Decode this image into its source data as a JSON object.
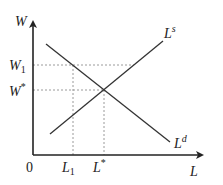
{
  "diagram": {
    "type": "labor-market supply and demand",
    "axes": {
      "y_label": "W",
      "x_label": "L",
      "origin_label": "0"
    },
    "curves": [
      {
        "name": "supply",
        "label_main": "L",
        "label_sup": "s"
      },
      {
        "name": "demand",
        "label_main": "L",
        "label_sup": "d"
      }
    ],
    "wage_levels": [
      {
        "label_main": "W",
        "label_sub": "1"
      },
      {
        "label_main": "W",
        "label_sup": "*"
      }
    ],
    "labor_levels": [
      {
        "label_main": "L",
        "label_sub": "1"
      },
      {
        "label_main": "L",
        "label_sup": "*"
      }
    ],
    "colors": {
      "line": "#333333",
      "dashed": "#999999",
      "text": "#222222"
    }
  }
}
